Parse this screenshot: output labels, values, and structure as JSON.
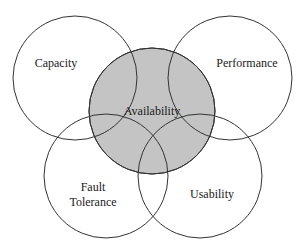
{
  "diagram": {
    "type": "venn",
    "center": {
      "label": "Availability",
      "fill": "#c4c4c4"
    },
    "outer": [
      {
        "id": "capacity",
        "label": "Capacity",
        "lines": [
          "Capacity"
        ]
      },
      {
        "id": "performance",
        "label": "Performance",
        "lines": [
          "Performance"
        ]
      },
      {
        "id": "fault-tolerance",
        "label": "Fault Tolerance",
        "lines": [
          "Fault",
          "Tolerance"
        ]
      },
      {
        "id": "usability",
        "label": "Usability",
        "lines": [
          "Usability"
        ]
      }
    ],
    "stroke": "#333333"
  }
}
